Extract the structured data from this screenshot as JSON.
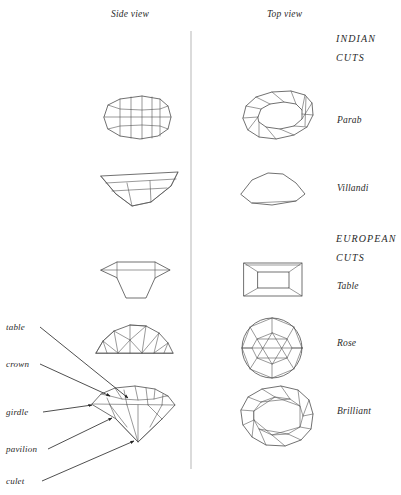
{
  "figure": {
    "title_columns": {
      "side": "Side view",
      "top": "Top view"
    },
    "groups": [
      {
        "id": "indian",
        "line1": "INDIAN",
        "line2": "CUTS"
      },
      {
        "id": "european",
        "line1": "EUROPEAN",
        "line2": "CUTS"
      }
    ],
    "cuts": [
      {
        "id": "parab",
        "label": "Parab",
        "group": "indian"
      },
      {
        "id": "villandi",
        "label": "Villandi",
        "group": "indian"
      },
      {
        "id": "table",
        "label": "Table",
        "group": "european"
      },
      {
        "id": "rose",
        "label": "Rose",
        "group": "european"
      },
      {
        "id": "brilliant",
        "label": "Brilliant",
        "group": "european"
      }
    ],
    "anatomy_labels": [
      {
        "id": "table",
        "label": "table"
      },
      {
        "id": "crown",
        "label": "crown"
      },
      {
        "id": "girdle",
        "label": "girdle"
      },
      {
        "id": "pavilion",
        "label": "pavilion"
      },
      {
        "id": "culet",
        "label": "culet"
      }
    ],
    "colors": {
      "ink": "#1a1a1a",
      "line": "#333333",
      "divider": "#9a9a9a",
      "background": "#ffffff"
    }
  }
}
